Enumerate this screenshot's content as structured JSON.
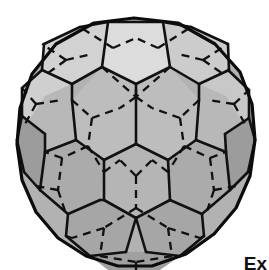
{
  "figure": {
    "name": "truncated-icosahedron",
    "common_names": [
      "buckyball",
      "soccer ball",
      "C60"
    ],
    "title": "",
    "caption_text": "Ex",
    "background_color": "#ffffff",
    "render_style": "shaded solid with visible solid edges and hidden dashed edges",
    "counts": {
      "faces": 32,
      "pentagons": 12,
      "hexagons": 20,
      "edges": 90,
      "vertices": 60
    },
    "colors": {
      "background": "#ffffff",
      "edge_visible": "#111111",
      "edge_hidden": "#111111",
      "outline": "#0c0c0c",
      "face_top_pentagon": "#dcdcdc",
      "face_light": "#d2d2d2",
      "face_mid": "#bdbdbd",
      "face_base": "#b2b2b2",
      "face_dark": "#a3a3a3",
      "face_darker": "#999999"
    },
    "notes": {
      "hidden_line_style": "dashed",
      "visible_line_style": "solid",
      "bottom_clipped": "true",
      "caption_clipped": "true"
    }
  },
  "geometry": {
    "silhouette": "M 134 18 L 178 23 L 215 44 L 240 72 L 252 104 L 255 140 L 250 176 L 236 208 L 214 234 L 186 254 L 152 266 L 118 266 L 86 256 L 58 238 L 36 212 L 22 180 L 17 144 L 20 108 L 32 74 L 56 44 L 94 23 Z",
    "faces": [
      {
        "id": "top-pentagon",
        "shade": "#dcdcdc",
        "points": "108,22 163,22 170,67 136,84 102,67"
      },
      {
        "id": "upper-left-hex-a",
        "shade": "#d2d2d2",
        "points": "108,22 102,67 72,84 42,70 44,44 80,27"
      },
      {
        "id": "upper-left-hex-b",
        "shade": "#cfcfcf",
        "points": "42,70 72,84 74,118 45,134 22,116 22,88"
      },
      {
        "id": "upper-right-hex-a",
        "shade": "#cccccc",
        "points": "163,22 191,27 228,44 229,70 199,84 170,67"
      },
      {
        "id": "upper-right-hex-b",
        "shade": "#c8c8c8",
        "points": "229,70 249,90 249,118 225,134 197,118 199,84"
      },
      {
        "id": "center-hex-left",
        "shade": "#bdbdbd",
        "points": "102,67 136,84 136,144 104,160 76,140 72,100"
      },
      {
        "id": "center-hex-right",
        "shade": "#bdbdbd",
        "points": "170,67 199,100 196,140 168,160 136,144 136,84"
      },
      {
        "id": "left-pent-upper",
        "shade": "#b8b8b8",
        "points": "72,84 72,100 76,140 45,152 24,128 45,96"
      },
      {
        "id": "right-pent-upper",
        "shade": "#b8b8b8",
        "points": "199,84 226,96 246,128 226,152 196,140 199,100"
      },
      {
        "id": "left-hex-mid",
        "shade": "#ababab",
        "points": "45,152 76,140 104,160 100,200 68,214 40,190"
      },
      {
        "id": "right-hex-mid",
        "shade": "#ababab",
        "points": "196,140 226,152 230,190 202,214 170,200 168,160"
      },
      {
        "id": "front-pentagon",
        "shade": "#b5b5b5",
        "points": "136,144 168,160 170,200 136,218 104,200 104,160"
      },
      {
        "id": "lower-left-hex",
        "shade": "#a6a6a6",
        "points": "68,214 100,200 104,200 136,218 126,252 90,256 66,236"
      },
      {
        "id": "lower-right-hex",
        "shade": "#a6a6a6",
        "points": "136,218 170,200 202,214 204,236 180,256 146,252"
      },
      {
        "id": "bottom-pentagon",
        "shade": "#a0a0a0",
        "points": "126,252 146,252 180,256 160,270 108,270 90,256"
      },
      {
        "id": "left-edge-pent",
        "shade": "#9c9c9c",
        "points": "22,116 45,134 45,152 40,190 24,172 17,140"
      },
      {
        "id": "right-edge-pent",
        "shade": "#9c9c9c",
        "points": "249,118 255,140 248,172 230,190 226,152 225,134"
      }
    ],
    "visible_edges": [
      "108,22 163,22",
      "108,22 80,27",
      "163,22 191,27",
      "80,27 44,44",
      "191,27 228,44",
      "44,44 42,70",
      "228,44 229,70",
      "42,70 72,84",
      "229,70 199,84",
      "102,67 136,84",
      "170,67 136,84",
      "102,67 108,22",
      "170,67 163,22",
      "102,67 72,84",
      "170,67 199,84",
      "72,84 72,100",
      "199,84 199,100",
      "42,70 22,88",
      "228,70 249,90",
      "22,88 22,116",
      "249,90 249,118",
      "72,100 76,140",
      "199,100 196,140",
      "136,84 136,144",
      "22,116 45,134",
      "249,118 225,134",
      "45,134 45,152",
      "225,134 226,152",
      "45,152 76,140",
      "226,152 196,140",
      "76,140 104,160",
      "196,140 168,160",
      "136,144 104,160",
      "136,144 168,160",
      "104,160 104,200",
      "168,160 170,200",
      "45,152 40,190",
      "226,152 230,190",
      "40,190 68,214",
      "230,190 202,214",
      "68,214 100,200",
      "202,214 170,200",
      "100,200 104,200",
      "104,200 136,218",
      "170,200 136,218",
      "68,214 66,236",
      "202,214 204,236",
      "66,236 90,256",
      "204,236 180,256",
      "136,218 126,252",
      "136,218 146,252",
      "90,256 126,252",
      "180,256 146,252",
      "17,140 24,172",
      "255,140 248,172",
      "22,116 17,140",
      "249,118 255,140",
      "24,172 40,190",
      "248,172 230,190"
    ],
    "hidden_edges": [
      "102,67 136,97",
      "170,67 136,97",
      "136,97 136,84",
      "113,48 80,27",
      "113,48 136,38",
      "158,48 191,27",
      "158,48 136,38",
      "66,60 42,44",
      "66,60 44,76",
      "66,60 92,54",
      "203,60 228,44",
      "203,60 226,76",
      "203,60 178,54",
      "36,104 22,88",
      "36,104 24,126",
      "36,104 62,100",
      "234,104 249,90",
      "234,104 246,126",
      "234,104 208,100",
      "72,100 92,118",
      "92,118 120,108",
      "92,118 88,146",
      "199,100 180,118",
      "180,118 152,108",
      "180,118 184,146",
      "88,146 62,158",
      "88,146 104,172",
      "184,146 210,158",
      "184,146 168,172",
      "136,97 120,108",
      "136,97 152,108",
      "62,158 45,152",
      "210,158 226,152",
      "62,158 58,190",
      "210,158 214,190",
      "136,176 120,160",
      "136,176 152,160",
      "136,176 136,208",
      "104,172 120,160",
      "168,172 152,160",
      "58,190 66,214",
      "214,190 206,214",
      "58,190 36,186",
      "214,190 236,186",
      "136,208 104,228",
      "136,208 168,228",
      "104,228 72,238",
      "168,228 200,238",
      "104,228 100,256",
      "168,228 172,256",
      "100,256 136,262",
      "172,256 136,262",
      "136,262 136,270",
      "72,238 66,236",
      "200,238 204,236"
    ]
  }
}
